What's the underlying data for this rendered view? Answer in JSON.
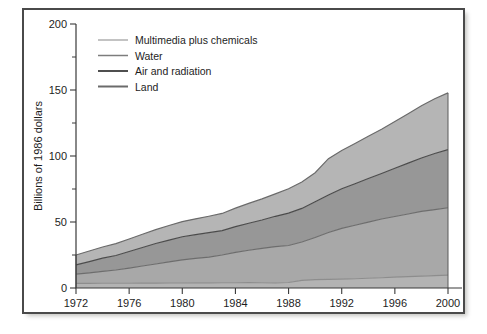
{
  "figure": {
    "frame_color": "#4a4a4a",
    "background": "#ffffff"
  },
  "chart_data": {
    "type": "area",
    "stacked": true,
    "title": "",
    "xlabel": "",
    "ylabel": "Billions of 1986 dollars",
    "xlim": [
      1972,
      2000
    ],
    "ylim": [
      0,
      200
    ],
    "grid": false,
    "legend_position": "top-left",
    "x_ticklabels": [
      "1972",
      "1976",
      "1980",
      "1984",
      "1988",
      "1992",
      "1996",
      "2000"
    ],
    "x_ticks": [
      1972,
      1976,
      1980,
      1984,
      1988,
      1992,
      1996,
      2000
    ],
    "y_ticklabels": [
      "0",
      "50",
      "100",
      "150",
      "200"
    ],
    "y_ticks": [
      0,
      50,
      100,
      150,
      200
    ],
    "y_minor_ticks": [
      25,
      75,
      125,
      175
    ],
    "x": [
      1972,
      1973,
      1974,
      1975,
      1976,
      1977,
      1978,
      1979,
      1980,
      1981,
      1982,
      1983,
      1984,
      1985,
      1986,
      1987,
      1988,
      1989,
      1990,
      1991,
      1992,
      1993,
      1994,
      1995,
      1996,
      1997,
      1998,
      1999,
      2000
    ],
    "series": [
      {
        "name": "Land",
        "color": "#b3b3b3",
        "edge_color": "#8d8d8d",
        "values": [
          3.5,
          3.5,
          3.6,
          3.6,
          3.6,
          3.7,
          3.7,
          3.8,
          3.8,
          3.9,
          3.9,
          4.0,
          4.0,
          4.1,
          4.0,
          3.8,
          4.2,
          5.8,
          6.3,
          6.5,
          6.7,
          7.0,
          7.4,
          7.8,
          8.2,
          8.6,
          9.0,
          9.4,
          9.8
        ]
      },
      {
        "name": "Air and radiation",
        "color": "#a8a8a8",
        "edge_color": "#6d6d6d",
        "values": [
          7.0,
          8.0,
          9.0,
          10.0,
          11.5,
          13.0,
          14.5,
          16.0,
          17.5,
          18.5,
          19.5,
          21.0,
          23.0,
          24.5,
          26.0,
          27.5,
          28.0,
          29.0,
          32.0,
          35.5,
          38.5,
          40.5,
          42.5,
          44.5,
          46.0,
          47.5,
          49.0,
          50.0,
          51.0
        ]
      },
      {
        "name": "Water",
        "color": "#979797",
        "edge_color": "#4b4b4b",
        "values": [
          7.0,
          8.5,
          10.0,
          11.0,
          12.5,
          14.0,
          15.5,
          16.5,
          17.5,
          18.0,
          18.5,
          18.5,
          19.5,
          20.5,
          21.5,
          23.0,
          24.5,
          25.5,
          27.0,
          28.5,
          30.0,
          31.5,
          33.0,
          34.5,
          36.5,
          38.5,
          40.5,
          42.5,
          44.0
        ]
      },
      {
        "name": "Multimedia plus chemicals",
        "color": "#b5b5b5",
        "edge_color": "#6a6a6a",
        "values": [
          7.5,
          8.0,
          8.5,
          9.0,
          9.5,
          10.0,
          10.5,
          11.0,
          11.5,
          12.0,
          12.5,
          13.0,
          14.0,
          15.0,
          16.0,
          17.0,
          18.5,
          20.0,
          22.0,
          27.5,
          29.0,
          30.5,
          32.0,
          33.5,
          35.5,
          37.5,
          39.5,
          41.5,
          43.0
        ]
      }
    ],
    "legend_entries": [
      {
        "label": "Multimedia plus chemicals",
        "swatch_color": "#9a9a9a"
      },
      {
        "label": "Water",
        "swatch_color": "#7d7d7d"
      },
      {
        "label": "Air and radiation",
        "swatch_color": "#4f4f4f"
      },
      {
        "label": "Land",
        "swatch_color": "#6b6b6b"
      }
    ]
  }
}
